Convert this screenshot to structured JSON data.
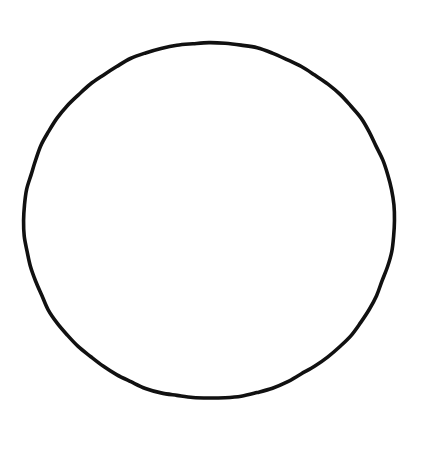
{
  "canvas": {
    "width": 431,
    "height": 451,
    "background_color": "#ffffff",
    "title": "Circle Outline"
  },
  "shapes": [
    {
      "name": "circle-outline",
      "type": "ellipse",
      "center_x": 209,
      "center_y": 220.5,
      "radius_x": 185,
      "radius_y": 178,
      "stroke_color": "#111111",
      "stroke_width": 3.6,
      "fill_color": "none",
      "style": "hand-drawn"
    }
  ],
  "caption": {
    "text": ""
  }
}
